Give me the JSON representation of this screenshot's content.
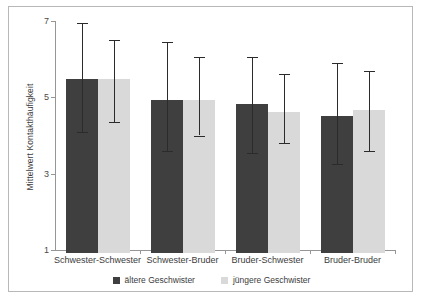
{
  "chart_data": {
    "type": "bar",
    "title": "",
    "xlabel": "",
    "ylabel": "Mittelwert Kontakthäufigkeit",
    "ylim": [
      1,
      7
    ],
    "yticks": [
      1,
      3,
      5,
      7
    ],
    "ytick_labels": [
      "1",
      "3",
      "5",
      "7"
    ],
    "grid": false,
    "legend_position": "bottom",
    "categories": [
      "Schwester-Schwester",
      "Schwester-Bruder",
      "Bruder-Schwester",
      "Bruder-Bruder"
    ],
    "series": [
      {
        "name": "ältere Geschwister",
        "color": "#3f3f3f",
        "values": [
          5.55,
          5.0,
          4.9,
          4.6
        ],
        "error_low": [
          4.1,
          3.6,
          3.55,
          3.25
        ],
        "error_high": [
          6.95,
          6.45,
          6.05,
          5.9
        ]
      },
      {
        "name": "jüngere Geschwister",
        "color": "#d9d9d9",
        "values": [
          5.55,
          5.0,
          4.7,
          4.75
        ],
        "error_low": [
          4.35,
          4.0,
          3.8,
          3.6
        ],
        "error_high": [
          6.5,
          6.05,
          5.6,
          5.7
        ]
      }
    ]
  },
  "legend": {
    "items": [
      {
        "label": "ältere Geschwister",
        "color": "#3f3f3f"
      },
      {
        "label": "jüngere Geschwister",
        "color": "#d9d9d9"
      }
    ]
  },
  "colors": {
    "series_dark": "#3f3f3f",
    "series_light": "#d9d9d9",
    "axis": "#969696",
    "frame": "#b8b8b8",
    "text": "#3c3c3c",
    "background": "#ffffff"
  }
}
